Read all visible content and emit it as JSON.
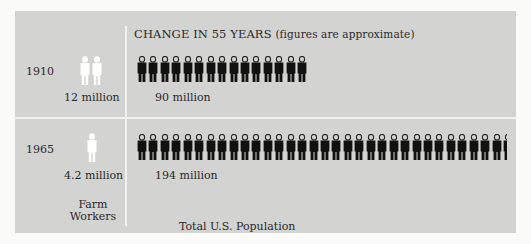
{
  "title": "CHANGE IN 55 YEARS",
  "subtitle": "(figures are approximate)",
  "rows": [
    {
      "year": "1910",
      "farm_label": "12 million",
      "total_label": "90 million",
      "farm_figures": 2,
      "total_figures": 15
    },
    {
      "year": "1965",
      "farm_label": "4.2 million",
      "total_label": "194 million",
      "farm_figures": 0.7,
      "total_figures": 32.3
    }
  ],
  "columns": {
    "farm": "Farm Workers",
    "farm_line1": "Farm",
    "farm_line2": "Workers",
    "total": "Total U.S. Population"
  },
  "colors": {
    "panel": "#d3d3d1",
    "figure_dark": "#111111",
    "figure_light": "#ffffff",
    "divider": "#f2f2f0"
  },
  "chart_data": {
    "type": "bar",
    "title": "CHANGE IN 55 YEARS (figures are approximate)",
    "categories": [
      "1910",
      "1965"
    ],
    "series": [
      {
        "name": "Farm Workers",
        "values": [
          12,
          4.2
        ],
        "unit": "million"
      },
      {
        "name": "Total U.S. Population",
        "values": [
          90,
          194
        ],
        "unit": "million"
      }
    ],
    "pictogram_unit": "1 figure ≈ 6 million people",
    "xlabel": "",
    "ylabel": "million people"
  }
}
